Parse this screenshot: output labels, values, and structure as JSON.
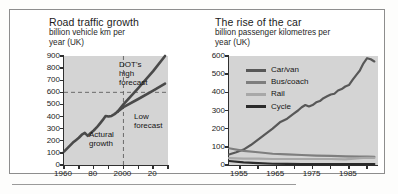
{
  "figure": {
    "charts": [
      {
        "id": "road-traffic-growth",
        "title": "Road traffic growth",
        "subtitle_line1": "billion vehicle km per",
        "subtitle_line2": "year (UK)",
        "annotations": {
          "high_forecast_line1": "DOT's",
          "high_forecast_line2": "high",
          "high_forecast_line3": "forecast",
          "low_forecast_line1": "Low",
          "low_forecast_line2": "forecast",
          "actual_line1": "Actural",
          "actual_line2": "growth"
        }
      },
      {
        "id": "rise-of-the-car",
        "title": "The rise of the car",
        "subtitle_line1": "billion passenger kilometres per",
        "subtitle_line2": "year (UK)",
        "legend": [
          {
            "label": "Car/van",
            "color": "#585858"
          },
          {
            "label": "Bus/coach",
            "color": "#7e7e7e"
          },
          {
            "label": "Rail",
            "color": "#a8a8a8"
          },
          {
            "label": "Cycle",
            "color": "#2b2b2b"
          }
        ]
      }
    ]
  },
  "chart_data": [
    {
      "type": "line",
      "id": "road-traffic-growth",
      "title": "Road traffic growth",
      "subtitle": "billion vehicle km per year (UK)",
      "xlabel": "",
      "ylabel": "billion vehicle km per year",
      "xlim": [
        1960,
        2030
      ],
      "ylim": [
        0,
        900
      ],
      "yticks": [
        0,
        100,
        200,
        300,
        400,
        500,
        600,
        700,
        800,
        900
      ],
      "ytick_labels": [
        "0",
        "100",
        "200",
        "300",
        "400",
        "500",
        "600",
        "700",
        "800",
        "900"
      ],
      "xticks": [
        1960,
        1970,
        1980,
        1990,
        2000,
        2010,
        2020,
        2030
      ],
      "xtick_labels": [
        "1960",
        "",
        "80",
        "",
        "2000",
        "",
        "20",
        ""
      ],
      "grid": false,
      "plot_background": "#d4d4d4",
      "reference_lines": [
        {
          "kind": "horizontal",
          "value": 600,
          "style": "dashed",
          "color": "#6a6a6a"
        },
        {
          "kind": "vertical",
          "value": 2000,
          "style": "dashed",
          "color": "#6a6a6a"
        }
      ],
      "series": [
        {
          "name": "Actural growth",
          "color": "#4a4a4a",
          "x": [
            1960,
            1962,
            1964,
            1966,
            1968,
            1970,
            1972,
            1974,
            1976,
            1978,
            1980,
            1982,
            1984,
            1986,
            1988,
            1990,
            1992,
            1994,
            1996
          ],
          "y": [
            110,
            135,
            160,
            185,
            205,
            225,
            250,
            265,
            240,
            265,
            285,
            310,
            340,
            370,
            405,
            400,
            405,
            420,
            440
          ]
        },
        {
          "name": "DOT's high forecast",
          "color": "#4a4a4a",
          "x": [
            1996,
            2000,
            2010,
            2020,
            2028
          ],
          "y": [
            440,
            500,
            635,
            775,
            900
          ]
        },
        {
          "name": "Low forecast",
          "color": "#4a4a4a",
          "x": [
            1996,
            2000,
            2010,
            2020,
            2028
          ],
          "y": [
            440,
            478,
            545,
            615,
            672
          ]
        }
      ],
      "annotations": [
        {
          "text": "DOT's high forecast",
          "x": 2002,
          "y": 830
        },
        {
          "text": "Low forecast",
          "x": 2008,
          "y": 400
        },
        {
          "text": "Actural growth",
          "x": 1980,
          "y": 185
        }
      ]
    },
    {
      "type": "line",
      "id": "rise-of-the-car",
      "title": "The rise of the car",
      "subtitle": "billion passenger kilometres per year (UK)",
      "xlabel": "",
      "ylabel": "billion passenger kilometres per year",
      "xlim": [
        1952,
        1993
      ],
      "ylim": [
        0,
        600
      ],
      "yticks": [
        0,
        100,
        200,
        300,
        400,
        500,
        600
      ],
      "ytick_labels": [
        "0",
        "100",
        "200",
        "300",
        "400",
        "500",
        "600"
      ],
      "xticks": [
        1955,
        1960,
        1965,
        1970,
        1975,
        1980,
        1985,
        1990
      ],
      "xtick_labels": [
        "1955",
        "",
        "1965",
        "",
        "1975",
        "",
        "1985",
        ""
      ],
      "grid": false,
      "legend_position": "upper left",
      "plot_background": "#d4d4d4",
      "series": [
        {
          "name": "Car/van",
          "color": "#585858",
          "x": [
            1952,
            1954,
            1956,
            1958,
            1960,
            1962,
            1964,
            1966,
            1968,
            1970,
            1971,
            1972,
            1973,
            1974,
            1975,
            1976,
            1977,
            1978,
            1979,
            1980,
            1981,
            1982,
            1983,
            1984,
            1985,
            1986,
            1987,
            1988,
            1989,
            1990,
            1991,
            1992
          ],
          "y": [
            58,
            70,
            85,
            110,
            140,
            170,
            200,
            235,
            255,
            285,
            300,
            318,
            330,
            322,
            330,
            345,
            352,
            368,
            378,
            388,
            392,
            410,
            418,
            432,
            440,
            468,
            495,
            520,
            560,
            588,
            582,
            570
          ]
        },
        {
          "name": "Bus/coach",
          "color": "#7e7e7e",
          "x": [
            1952,
            1956,
            1960,
            1964,
            1968,
            1972,
            1976,
            1980,
            1984,
            1988,
            1990,
            1992
          ],
          "y": [
            92,
            78,
            70,
            62,
            58,
            55,
            52,
            50,
            48,
            46,
            46,
            45
          ]
        },
        {
          "name": "Rail",
          "color": "#a8a8a8",
          "x": [
            1952,
            1956,
            1960,
            1964,
            1968,
            1972,
            1976,
            1980,
            1984,
            1988,
            1990,
            1992
          ],
          "y": [
            38,
            35,
            35,
            33,
            33,
            33,
            33,
            33,
            31,
            38,
            40,
            39
          ]
        },
        {
          "name": "Cycle",
          "color": "#2b2b2b",
          "x": [
            1952,
            1956,
            1960,
            1964,
            1968,
            1972,
            1976,
            1980,
            1984,
            1988,
            1990,
            1992
          ],
          "y": [
            22,
            14,
            10,
            7,
            6,
            5,
            5,
            5,
            5,
            5,
            5,
            5
          ]
        }
      ]
    }
  ]
}
